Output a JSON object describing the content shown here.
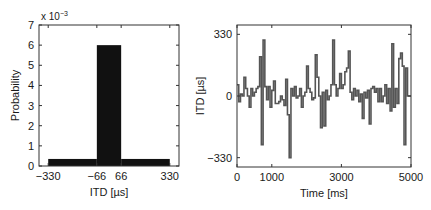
{
  "chart_data": [
    {
      "type": "bar",
      "title": "",
      "xlabel": "ITD [µs]",
      "ylabel": "Probability",
      "y_exponent_label": "x 10",
      "y_exponent": "−3",
      "bins": [
        {
          "x0": -330,
          "x1": -66,
          "value": 0.00035
        },
        {
          "x0": -66,
          "x1": 66,
          "value": 0.006
        },
        {
          "x0": 66,
          "x1": 330,
          "value": 0.00035
        }
      ],
      "categories": [
        "-330 to -66",
        "-66 to 66",
        "66 to 330"
      ],
      "values": [
        0.00035,
        0.006,
        0.00035
      ],
      "xlim": [
        -380,
        380
      ],
      "ylim": [
        0,
        0.007
      ],
      "xticks": [
        -330,
        -66,
        66,
        330
      ],
      "xtick_labels": [
        "−330",
        "−66",
        "66",
        "330"
      ],
      "yticks": [
        0,
        1,
        2,
        3,
        4,
        5,
        6,
        7
      ],
      "ytick_labels": [
        "0",
        "1",
        "2",
        "3",
        "4",
        "5",
        "6",
        "7"
      ],
      "bar_color": "#111111",
      "grid": false,
      "legend": null
    },
    {
      "type": "line",
      "style": "step",
      "title": "",
      "xlabel": "Time [ms]",
      "ylabel": "ITD [µs]",
      "xlim": [
        0,
        5000
      ],
      "ylim": [
        -380,
        380
      ],
      "xticks": [
        0,
        1000,
        3000,
        5000
      ],
      "xtick_labels": [
        "0",
        "1000",
        "3000",
        "5000"
      ],
      "yticks": [
        -330,
        0,
        330
      ],
      "ytick_labels": [
        "−330",
        "0",
        "330"
      ],
      "step_ms": 50,
      "line_color": "#555555",
      "grid": false,
      "legend": null,
      "series": [
        {
          "name": "ITD",
          "values": [
            60,
            -30,
            10,
            0,
            100,
            40,
            0,
            -60,
            40,
            0,
            20,
            40,
            50,
            210,
            -260,
            300,
            50,
            -20,
            50,
            -60,
            30,
            80,
            -40,
            -40,
            -30,
            0,
            -20,
            -50,
            90,
            -100,
            -330,
            40,
            0,
            50,
            -10,
            0,
            40,
            -60,
            0,
            20,
            160,
            40,
            20,
            -20,
            -10,
            220,
            100,
            0,
            -170,
            20,
            -160,
            30,
            -20,
            0,
            60,
            300,
            60,
            0,
            40,
            120,
            40,
            60,
            130,
            150,
            240,
            20,
            -20,
            40,
            0,
            30,
            -30,
            10,
            -120,
            20,
            -10,
            30,
            -150,
            40,
            50,
            20,
            40,
            -30,
            40,
            -30,
            0,
            60,
            -40,
            40,
            -80,
            280,
            -60,
            40,
            -40,
            200,
            230,
            160,
            -260,
            150,
            0,
            0
          ]
        }
      ]
    }
  ]
}
